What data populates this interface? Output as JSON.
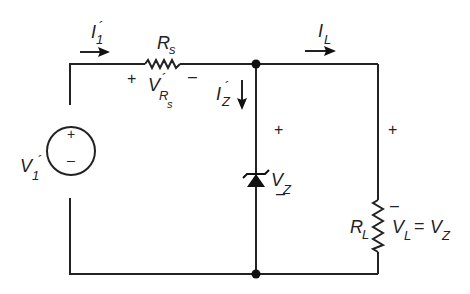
{
  "diagram": {
    "type": "circuit-schematic",
    "components": {
      "source": {
        "label_main": "V",
        "label_sub": "1",
        "prime": "´",
        "plus": "+",
        "minus": "–"
      },
      "series_resistor": {
        "label_main": "R",
        "label_sub": "s"
      },
      "series_voltage": {
        "label_main": "V",
        "prime": "´",
        "label_sub": "R",
        "label_subsub": "s",
        "plus": "+",
        "minus": "–"
      },
      "zener": {
        "label_main": "V",
        "label_sub": "Z",
        "plus": "+",
        "minus": "–"
      },
      "load_resistor": {
        "label_main": "R",
        "label_sub": "L"
      },
      "load_voltage": {
        "label_main": "V",
        "label_sub": "L",
        "eq": "=",
        "label_main2": "V",
        "label_sub2": "Z",
        "plus": "+",
        "minus": "–"
      }
    },
    "currents": {
      "input": {
        "label_main": "I",
        "label_sub": "1",
        "prime": "´"
      },
      "zener": {
        "label_main": "I",
        "label_sub": "Z",
        "prime": "´"
      },
      "load": {
        "label_main": "I",
        "label_sub": "L"
      }
    }
  }
}
